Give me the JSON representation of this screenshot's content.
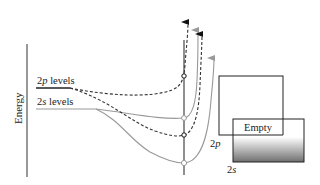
{
  "diagram": {
    "axis_label": "Energy",
    "levels": [
      {
        "id": "2p",
        "label_main": "2",
        "label_italic": "p",
        "label_rest": " levels"
      },
      {
        "id": "2s",
        "label_main": "2",
        "label_italic": "s",
        "label_rest": " levels"
      }
    ],
    "bands": [
      {
        "id": "2p-band",
        "label_main": "2",
        "label_italic": "p"
      },
      {
        "id": "2s-band",
        "label_main": "2",
        "label_italic": "s"
      }
    ],
    "empty_label": "Empty",
    "colors": {
      "solid_line": "#999999",
      "dashed_line": "#333333",
      "dark_line": "#222222",
      "gradient_top": "#ffffff",
      "gradient_bottom": "#777777"
    }
  }
}
